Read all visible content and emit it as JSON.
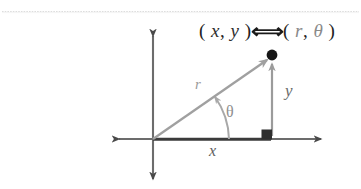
{
  "figure": {
    "title_expression": {
      "cartesian_open": "( ",
      "x_symbol": "x",
      "comma": ", ",
      "y_symbol": "y",
      "cartesian_close": " )",
      "equivalence_symbol": "⟺",
      "polar_open": "( ",
      "r_symbol": "r",
      "polar_comma": ", ",
      "theta_symbol": "θ",
      "polar_close": " )"
    },
    "labels": {
      "r": "r",
      "theta": "θ",
      "y": "y",
      "x": "x"
    },
    "colors": {
      "background": "#ffffff",
      "axis": "#4a4a4a",
      "ray": "#a0a0a0",
      "arc": "#a8a8a8",
      "leg_vertical": "#9b9b9b",
      "leg_horizontal": "#3a3a3a",
      "point": "#111111",
      "right_angle_marker": "#2e2e2e",
      "top_rule": "#d8d8d8",
      "text_primary": "#2b2b2b",
      "text_dim": "#8a8a8a"
    },
    "geometry": {
      "origin": [
        153,
        139
      ],
      "point": [
        272,
        55
      ],
      "x_axis_span": [
        112,
        328
      ],
      "y_axis_span": [
        30,
        185
      ],
      "foot_of_perpendicular": [
        272,
        139
      ],
      "angle_degrees": 35
    },
    "markers": {
      "point_dot": "filled-circle",
      "right_angle": "filled-square"
    },
    "top_rule_y": 11
  }
}
